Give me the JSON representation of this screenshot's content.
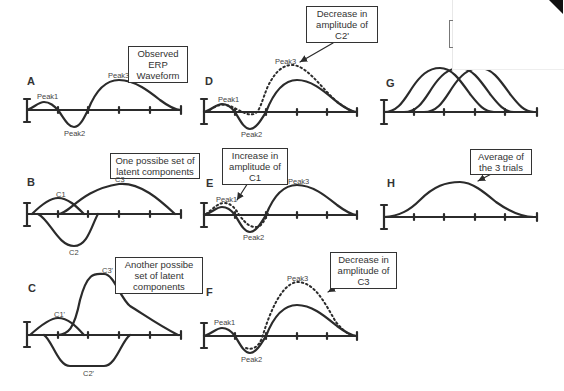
{
  "panels": {
    "A": {
      "letter": "A",
      "callout": "Observed ERP Waveform",
      "labels": {
        "peak1": "Peak1",
        "peak2": "Peak2",
        "peak3": "Peak3"
      }
    },
    "B": {
      "letter": "B",
      "callout": "One possibe set of latent components",
      "labels": {
        "c1": "C1",
        "c2": "C2",
        "c3": "C3"
      }
    },
    "C": {
      "letter": "C",
      "callout": "Another possibe set of latent components",
      "labels": {
        "c1": "C1'",
        "c2": "C2'",
        "c3": "C3'"
      }
    },
    "D": {
      "letter": "D",
      "callout": "Decrease in amplitude of C2'",
      "labels": {
        "peak1": "Peak1",
        "peak2": "Peak2",
        "peak3": "Peak3"
      }
    },
    "E": {
      "letter": "E",
      "callout": "Increase in amplitude of C1",
      "labels": {
        "peak1": "Peak1",
        "peak2": "Peak2",
        "peak3": "Peak3"
      }
    },
    "F": {
      "letter": "F",
      "callout": "Decrease in amplitude of C3",
      "labels": {
        "peak1": "Peak1",
        "peak2": "Peak2",
        "peak3": "Peak3"
      }
    },
    "G": {
      "letter": "G"
    },
    "H": {
      "letter": "H",
      "callout": "Average of the 3 trials"
    }
  },
  "colors": {
    "line": "#2b2b2b",
    "background": "#ffffff"
  }
}
